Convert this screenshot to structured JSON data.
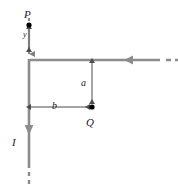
{
  "figure": {
    "background_color": "#ffffff",
    "wire_color": "#808080",
    "dimension_color": "#4d4d4d",
    "label_color": "#1a1a1a",
    "point_color": "#000000"
  },
  "labels": {
    "point_p": "P",
    "point_q": "Q",
    "current": "I",
    "distance_vertical_small": "y",
    "distance_a": "a",
    "distance_b": "b"
  },
  "geometry": {
    "corner_x": 29,
    "corner_y": 60,
    "horizontal_wire_end_x": 160,
    "vertical_wire_end_y": 168,
    "point_p_x": 29,
    "point_p_y": 25,
    "point_q_x": 92,
    "point_q_y": 107
  },
  "annotations": {
    "current_direction": "downward along vertical wire",
    "incoming_current_direction": "leftward along horizontal wire",
    "dashed_extension_top": true,
    "dashed_extension_bottom": true,
    "dashed_extension_right": true
  }
}
